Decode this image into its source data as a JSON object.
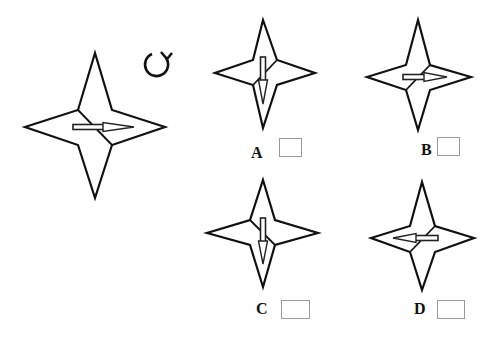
{
  "puzzle": {
    "type": "mental-rotation",
    "rotate_icon": "clockwise-rotate-icon",
    "reference_figure": {
      "shape": "four-point-star",
      "arrow_direction": "right",
      "crease": "upper-left-to-lower-right"
    },
    "options": [
      {
        "label": "A",
        "arrow_direction": "down",
        "crease": "upper-right-to-lower-left",
        "checkbox_checked": false
      },
      {
        "label": "B",
        "arrow_direction": "right",
        "crease": "upper-right-to-lower-left",
        "checkbox_checked": false
      },
      {
        "label": "C",
        "arrow_direction": "down",
        "crease": "upper-left-to-lower-right",
        "checkbox_checked": false
      },
      {
        "label": "D",
        "arrow_direction": "left",
        "crease": "upper-right-to-lower-left",
        "checkbox_checked": false
      }
    ]
  },
  "colors": {
    "stroke": "#111111",
    "background": "#ffffff",
    "checkbox_border": "#9a9a9a"
  }
}
